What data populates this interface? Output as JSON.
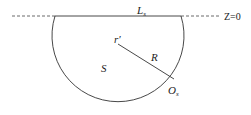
{
  "diagram": {
    "labels": {
      "surface_line": "L",
      "surface_line_sub": "s",
      "plane": "Z=0",
      "center": "r′",
      "radius": "R",
      "region": "S",
      "point": "O",
      "point_sub": "s"
    },
    "colors": {
      "stroke": "#333333",
      "background": "#ffffff"
    }
  }
}
